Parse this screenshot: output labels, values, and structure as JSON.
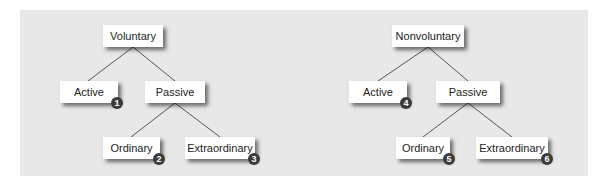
{
  "diagrams": [
    {
      "root": "Voluntary",
      "active": {
        "label": "Active",
        "badge": "1"
      },
      "passive": "Passive",
      "ordinary": {
        "label": "Ordinary",
        "badge": "2"
      },
      "extraordinary": {
        "label": "Extraordinary",
        "badge": "3"
      }
    },
    {
      "root": "Nonvoluntary",
      "active": {
        "label": "Active",
        "badge": "4"
      },
      "passive": "Passive",
      "ordinary": {
        "label": "Ordinary",
        "badge": "5"
      },
      "extraordinary": {
        "label": "Extraordinary",
        "badge": "6"
      }
    }
  ],
  "colors": {
    "panel": "#e8e8e8",
    "node": "#ffffff",
    "badge": "#3a3a3a",
    "line": "#555555"
  }
}
